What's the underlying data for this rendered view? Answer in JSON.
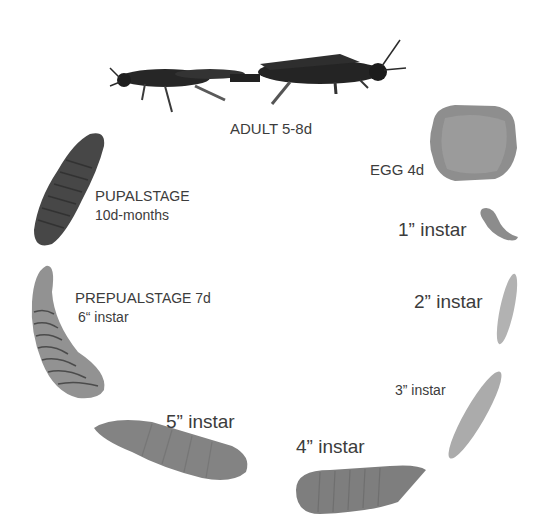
{
  "diagram": {
    "type": "life-cycle",
    "colors": {
      "background": "#ffffff",
      "label_text": "#3c3c3c",
      "adult": "#2a2a2a",
      "pupa": "#4a4a4a",
      "prepupa": "#8a8a8a",
      "egg": "#8e8e8e",
      "larva_early": "#a8a8a8",
      "larva_late": "#7d7d7d"
    },
    "stages": [
      {
        "id": "adult",
        "label": "ADULT  5-8d"
      },
      {
        "id": "egg",
        "label": "EGG  4d"
      },
      {
        "id": "instar1",
        "label": "1” instar"
      },
      {
        "id": "instar2",
        "label": "2” instar"
      },
      {
        "id": "instar3",
        "label": "3” instar"
      },
      {
        "id": "instar4",
        "label": "4” instar"
      },
      {
        "id": "instar5",
        "label": "5” instar"
      },
      {
        "id": "prepupa",
        "label_bold": "PREPUAL",
        "label_rest": "STAGE 7d",
        "sublabel": "6“  instar"
      },
      {
        "id": "pupa",
        "label_bold": "PUPAL",
        "label_rest": "STAGE",
        "sublabel": "10d-months"
      }
    ]
  }
}
